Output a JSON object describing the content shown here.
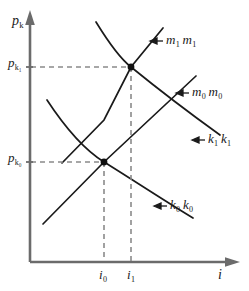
{
  "figure": {
    "background_color": "#ffffff",
    "line_color": "#1a1a1a",
    "axis_color": "#6b6b6b",
    "dash_color": "#8a8a8a",
    "axes": {
      "y_axis_label_main": "p",
      "y_axis_label_sub": "k",
      "x_axis_label_main": "i",
      "x_axis_label_sub": ""
    },
    "y_ticks": [
      {
        "main": "p",
        "sub": "k₁",
        "value_y": 67
      },
      {
        "main": "p",
        "sub": "k₀",
        "value_y": 162
      }
    ],
    "x_ticks": [
      {
        "main": "i",
        "sub": "0",
        "value_x": 104
      },
      {
        "main": "i",
        "sub": "1",
        "value_x": 131
      }
    ],
    "curve_labels": [
      {
        "main_a": "m",
        "sub_a": "1",
        "main_b": "m",
        "sub_b": "1",
        "name": "m1-m1"
      },
      {
        "main_a": "m",
        "sub_a": "0",
        "main_b": "m",
        "sub_b": "0",
        "name": "m0-m0"
      },
      {
        "main_a": "k",
        "sub_a": "1",
        "main_b": "k",
        "sub_b": "1",
        "name": "k1-k1"
      },
      {
        "main_a": "k",
        "sub_a": "0",
        "main_b": "k",
        "sub_b": "0",
        "name": "k0-k0"
      }
    ],
    "equilibria": [
      {
        "name": "equilibrium-1",
        "x": 131,
        "y": 67
      },
      {
        "name": "equilibrium-0",
        "x": 104,
        "y": 162
      }
    ]
  }
}
